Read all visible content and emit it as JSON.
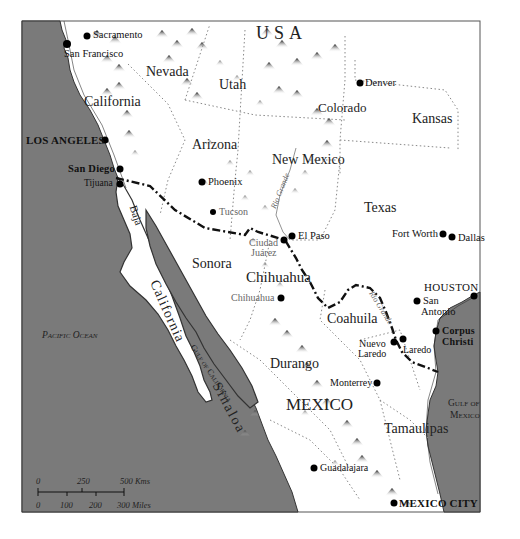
{
  "map": {
    "title": "",
    "colors": {
      "ocean": "#7a7a7a",
      "land": "#ffffff",
      "border_line": "#111111",
      "coast": "#333333",
      "mountain": "#333333",
      "state_border": "#888888",
      "river": "#777777"
    },
    "countries": [
      {
        "id": "usa",
        "label": "USA"
      },
      {
        "id": "mexico",
        "label": "MEXICO"
      }
    ],
    "states": [
      {
        "id": "nevada",
        "label": "Nevada"
      },
      {
        "id": "utah",
        "label": "Utah"
      },
      {
        "id": "california",
        "label": "California"
      },
      {
        "id": "colorado",
        "label": "Colorado"
      },
      {
        "id": "kansas",
        "label": "Kansas"
      },
      {
        "id": "arizona",
        "label": "Arizona"
      },
      {
        "id": "new-mexico",
        "label": "New Mexico"
      },
      {
        "id": "texas",
        "label": "Texas"
      },
      {
        "id": "sonora",
        "label": "Sonora"
      },
      {
        "id": "chihuahua",
        "label": "Chihuahua"
      },
      {
        "id": "coahuila",
        "label": "Coahuila"
      },
      {
        "id": "durango",
        "label": "Durango"
      },
      {
        "id": "sinaloa",
        "label": "Sinaloa"
      },
      {
        "id": "tamaulipas",
        "label": "Tamaulipas"
      },
      {
        "id": "baja-california-1",
        "label": "Baja"
      },
      {
        "id": "baja-california-2",
        "label": "California"
      }
    ],
    "cities": [
      {
        "id": "sacramento",
        "label": "Sacramento"
      },
      {
        "id": "san-francisco",
        "label": "San Francisco"
      },
      {
        "id": "los-angeles",
        "label": "LOS ANGELES"
      },
      {
        "id": "san-diego",
        "label": "San Diego"
      },
      {
        "id": "tijuana",
        "label": "Tijuana"
      },
      {
        "id": "denver",
        "label": "Denver"
      },
      {
        "id": "phoenix",
        "label": "Phoenix"
      },
      {
        "id": "tucson",
        "label": "Tucson"
      },
      {
        "id": "el-paso",
        "label": "El Paso"
      },
      {
        "id": "ciudad-juarez-1",
        "label": "Ciudad"
      },
      {
        "id": "ciudad-juarez-2",
        "label": "Juárez"
      },
      {
        "id": "chihuahua-city",
        "label": "Chihuahua"
      },
      {
        "id": "fort-worth",
        "label": "Fort Worth"
      },
      {
        "id": "dallas",
        "label": "Dallas"
      },
      {
        "id": "houston",
        "label": "HOUSTON"
      },
      {
        "id": "san-antonio-1",
        "label": "San"
      },
      {
        "id": "san-antonio-2",
        "label": "Antonio"
      },
      {
        "id": "corpus-christi-1",
        "label": "Corpus"
      },
      {
        "id": "corpus-christi-2",
        "label": "Christi"
      },
      {
        "id": "nuevo-laredo-1",
        "label": "Nuevo"
      },
      {
        "id": "nuevo-laredo-2",
        "label": "Laredo"
      },
      {
        "id": "laredo",
        "label": "Laredo"
      },
      {
        "id": "monterrey",
        "label": "Monterrey"
      },
      {
        "id": "guadalajara",
        "label": "Guadalajara"
      },
      {
        "id": "mexico-city",
        "label": "MEXICO CITY"
      }
    ],
    "water": [
      {
        "id": "pacific",
        "label": "Pacific Ocean"
      },
      {
        "id": "gulf-mexico-1",
        "label": "Gulf of"
      },
      {
        "id": "gulf-mexico-2",
        "label": "Mexico"
      },
      {
        "id": "gulf-california",
        "label": "Gulf of California"
      }
    ],
    "rivers": [
      {
        "id": "rio-grande-north",
        "label": "Rio Grande"
      },
      {
        "id": "rio-grande-south",
        "label": "Rio Grande"
      }
    ],
    "scale_bar": {
      "km_ticks": [
        "0",
        "250",
        "500 Kms"
      ],
      "mile_ticks": [
        "0",
        "100",
        "200",
        "300 Miles"
      ]
    }
  }
}
